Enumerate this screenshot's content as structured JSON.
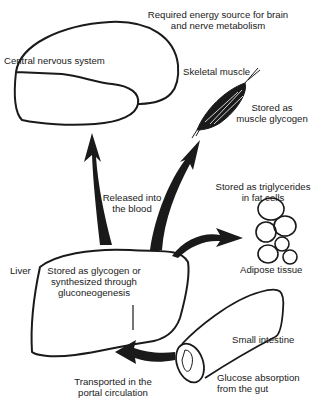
{
  "diagram": {
    "colors": {
      "ink": "#1a1a1a",
      "background": "#ffffff"
    },
    "nodes": {
      "brain": {
        "label": "Central nervous system",
        "caption_line1": "Required energy source for brain",
        "caption_line2": "and nerve metabolism"
      },
      "muscle": {
        "label": "Skeletal muscle",
        "caption_line1": "Stored as",
        "caption_line2": "muscle glycogen"
      },
      "adipose": {
        "label": "Adipose tissue",
        "caption_line1": "Stored as triglycerides",
        "caption_line2": "in fat cells"
      },
      "liver": {
        "label": "Liver",
        "caption_line1": "Stored as glycogen or",
        "caption_line2": "synthesized through",
        "caption_line3": "gluconeogenesis"
      },
      "intestine": {
        "label": "Small intestine",
        "caption_line1": "Glucose absorption",
        "caption_line2": "from the gut"
      }
    },
    "edges": {
      "blood": {
        "label_line1": "Released into",
        "label_line2": "the blood"
      },
      "portal": {
        "label_line1": "Transported in the",
        "label_line2": "portal circulation"
      }
    }
  }
}
